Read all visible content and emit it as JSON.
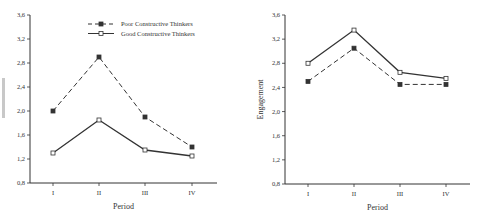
{
  "chart_data": [
    {
      "type": "line",
      "title": "",
      "xlabel": "Period",
      "ylabel": "",
      "categories": [
        "I",
        "II",
        "III",
        "IV"
      ],
      "ylim": [
        0.8,
        3.6
      ],
      "yticks": [
        "0,8",
        "1,2",
        "1,6",
        "2,0",
        "2,4",
        "2,8",
        "3,2",
        "3,6"
      ],
      "grid": false,
      "legend_position": "top-center",
      "series": [
        {
          "name": "Poor Constructive Thinkers",
          "style": "dashed",
          "marker": "filled-square",
          "values": [
            2.0,
            2.9,
            1.9,
            1.4
          ]
        },
        {
          "name": "Good Constructive Thinkers",
          "style": "solid",
          "marker": "open-square",
          "values": [
            1.3,
            1.85,
            1.35,
            1.25
          ]
        }
      ]
    },
    {
      "type": "line",
      "title": "",
      "xlabel": "Period",
      "ylabel": "Engagement",
      "categories": [
        "I",
        "II",
        "III",
        "IV"
      ],
      "ylim": [
        0.8,
        3.6
      ],
      "yticks": [
        "0,8",
        "1,2",
        "1,6",
        "2,0",
        "2,4",
        "2,8",
        "3,2",
        "3,6"
      ],
      "grid": false,
      "legend_position": "none",
      "series": [
        {
          "name": "Poor Constructive Thinkers",
          "style": "dashed",
          "marker": "filled-square",
          "values": [
            2.5,
            3.05,
            2.45,
            2.45
          ]
        },
        {
          "name": "Good Constructive Thinkers",
          "style": "solid",
          "marker": "open-square",
          "values": [
            2.8,
            3.35,
            2.65,
            2.55
          ]
        }
      ]
    }
  ],
  "colors": {
    "line": "#333333",
    "text": "#333333",
    "background": "#ffffff"
  }
}
